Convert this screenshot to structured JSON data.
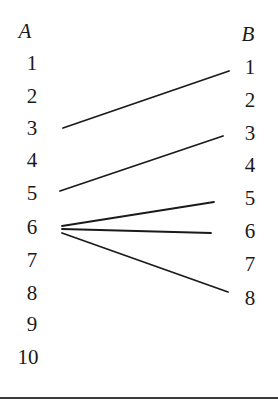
{
  "diagram": {
    "type": "mapping",
    "set_a": {
      "label": "A",
      "elements": [
        "1",
        "2",
        "3",
        "4",
        "5",
        "6",
        "7",
        "8",
        "9",
        "10"
      ]
    },
    "set_b": {
      "label": "B",
      "elements": [
        "1",
        "2",
        "3",
        "4",
        "5",
        "6",
        "7",
        "8"
      ]
    },
    "edges": [
      {
        "from": "3",
        "to": "1"
      },
      {
        "from": "5",
        "to": "3"
      },
      {
        "from": "6",
        "to": "5"
      },
      {
        "from": "6",
        "to": "6"
      },
      {
        "from": "6",
        "to": "8"
      }
    ],
    "colors": {
      "line": "#1a1a1a",
      "text": "#1a1a1a",
      "background": "#ffffff"
    }
  }
}
